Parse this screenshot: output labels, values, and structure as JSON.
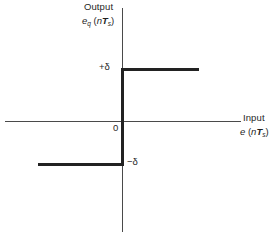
{
  "figure": {
    "name": "quantizer-transfer-characteristic",
    "background_color": "#ffffff",
    "curve_color": "#222222",
    "axis_color": "#4a4a4a"
  },
  "labels": {
    "y_axis_title": "Output",
    "y_axis_variable_base": "e",
    "y_axis_variable_sub": "q",
    "y_axis_variable_arg_open": " (",
    "y_axis_variable_arg_n": "n",
    "y_axis_variable_arg_T": "T",
    "y_axis_variable_arg_sub": "s",
    "y_axis_variable_arg_close": ")",
    "x_axis_title": "Input",
    "x_axis_variable_base": "e",
    "x_axis_variable_arg_open": " (",
    "x_axis_variable_arg_n": "n",
    "x_axis_variable_arg_T": "T",
    "x_axis_variable_arg_sub": "s",
    "x_axis_variable_arg_close": ")",
    "tick_positive": "+δ",
    "tick_negative": "−δ",
    "tick_origin": "0"
  },
  "chart_data": {
    "type": "line",
    "title": "",
    "subtitle": "",
    "xlabel": "Input  e (nTs)",
    "ylabel": "Output  eq (nTs)",
    "grid": false,
    "legend": null,
    "xlim": [
      -1.0,
      1.0
    ],
    "ylim": [
      -1.5,
      1.5
    ],
    "xticks": [
      0
    ],
    "xticklabels": [
      "0"
    ],
    "yticks": [
      -1,
      1
    ],
    "yticklabels": [
      "−δ",
      "+δ"
    ],
    "series": [
      {
        "name": "quantizer output",
        "segments": [
          {
            "name": "negative-plateau",
            "x": [
              -1.0,
              0.0
            ],
            "y": [
              -1.0,
              -1.0
            ]
          },
          {
            "name": "jump-at-origin",
            "x": [
              0.0,
              0.0
            ],
            "y": [
              -1.0,
              1.0
            ]
          },
          {
            "name": "positive-plateau",
            "x": [
              0.0,
              0.92
            ],
            "y": [
              1.0,
              1.0
            ]
          }
        ]
      }
    ],
    "annotations": [
      {
        "text": "+δ",
        "x": -0.28,
        "y": 1.0
      },
      {
        "text": "−δ",
        "x": 0.07,
        "y": -1.0
      },
      {
        "text": "0",
        "x": -0.1,
        "y": -0.09
      }
    ]
  }
}
